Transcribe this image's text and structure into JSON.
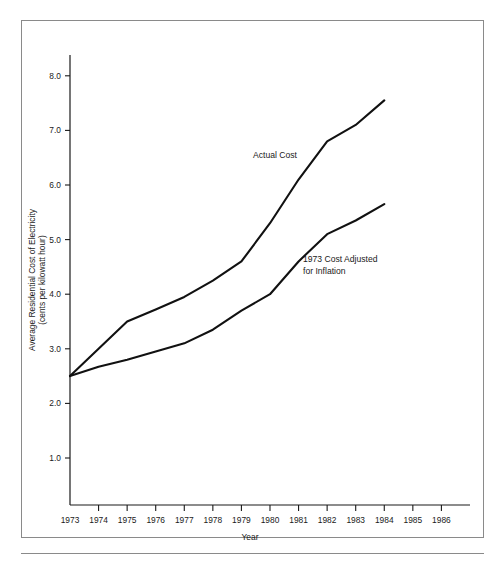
{
  "figure": {
    "frame_color": "#8a8a8a",
    "background": "#ffffff",
    "line_color": "#111111"
  },
  "axes": {
    "y_title_line1": "Average Residential Cost of Electricity",
    "y_title_line2": "(cents per kilowatt hour)",
    "x_title": "Year",
    "y_ticks": [
      "1.0",
      "2.0",
      "3.0",
      "4.0",
      "5.0",
      "6.0",
      "7.0",
      "8.0"
    ],
    "x_ticks": [
      "1973",
      "1974",
      "1975",
      "1976",
      "1977",
      "1978",
      "1979",
      "1980",
      "1981",
      "1982",
      "1983",
      "1984",
      "1985",
      "1986"
    ]
  },
  "annotations": {
    "actual_cost": "Actual Cost",
    "inflation_line1": "1973 Cost Adjusted",
    "inflation_line2": "for Inflation"
  },
  "chart_data": {
    "type": "line",
    "title": "",
    "subtitle": "",
    "xlabel": "Year",
    "ylabel": "Average Residential Cost of Electricity (cents per kilowatt hour)",
    "xlim": [
      1973,
      1986
    ],
    "ylim": [
      0.0,
      8.6
    ],
    "yticks": [
      1.0,
      2.0,
      3.0,
      4.0,
      5.0,
      6.0,
      7.0,
      8.0
    ],
    "xticks": [
      1973,
      1974,
      1975,
      1976,
      1977,
      1978,
      1979,
      1980,
      1981,
      1982,
      1983,
      1984,
      1985,
      1986
    ],
    "grid": false,
    "legend": "inline-annotations",
    "series": [
      {
        "name": "Actual Cost",
        "x": [
          1973,
          1974,
          1975,
          1976,
          1977,
          1978,
          1979,
          1980,
          1981,
          1982,
          1983,
          1984
        ],
        "values": [
          2.5,
          3.0,
          3.5,
          3.72,
          3.95,
          4.25,
          4.6,
          5.3,
          6.1,
          6.8,
          7.1,
          7.55
        ]
      },
      {
        "name": "1973 Cost Adjusted for Inflation",
        "x": [
          1973,
          1974,
          1975,
          1976,
          1977,
          1978,
          1979,
          1980,
          1981,
          1982,
          1983,
          1984
        ],
        "values": [
          2.5,
          2.67,
          2.8,
          2.95,
          3.1,
          3.35,
          3.7,
          4.0,
          4.6,
          5.1,
          5.35,
          5.65
        ]
      }
    ]
  }
}
